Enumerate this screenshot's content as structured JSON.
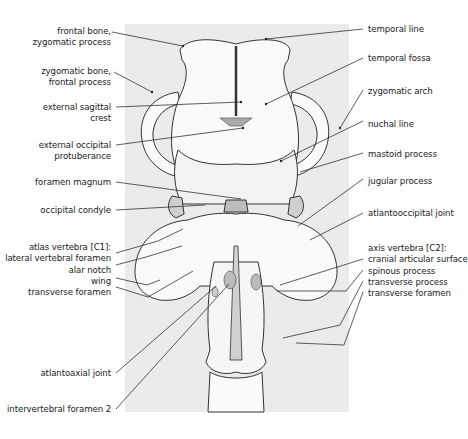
{
  "diagram": {
    "background_panel_color": "#ebebeb",
    "line_color": "#333333",
    "labels_left": [
      {
        "id": "frontal-zygomatic",
        "lines": [
          "frontal bone,",
          "zygomatic process"
        ]
      },
      {
        "id": "zygomatic-frontal",
        "lines": [
          "zygomatic bone,",
          "frontal process"
        ]
      },
      {
        "id": "ext-sagittal-crest",
        "lines": [
          "external sagittal",
          "crest"
        ]
      },
      {
        "id": "ext-occipital-protuberance",
        "lines": [
          "external occipital",
          "protuberance"
        ]
      },
      {
        "id": "foramen-magnum",
        "lines": [
          "foramen magnum"
        ]
      },
      {
        "id": "occipital-condyle",
        "lines": [
          "occipital condyle"
        ]
      },
      {
        "id": "atlas-group",
        "lines": [
          "atlas vertebra [C1]:",
          "lateral vertebral foramen",
          "alar notch",
          "wing",
          "transverse foramen"
        ]
      },
      {
        "id": "atlantoaxial-joint",
        "lines": [
          "atlantoaxial joint"
        ]
      },
      {
        "id": "intervertebral-foramen-2",
        "lines": [
          "intervertebral foramen 2"
        ]
      }
    ],
    "labels_right": [
      {
        "id": "temporal-line",
        "lines": [
          "temporal line"
        ]
      },
      {
        "id": "temporal-fossa",
        "lines": [
          "temporal fossa"
        ]
      },
      {
        "id": "zygomatic-arch",
        "lines": [
          "zygomatic arch"
        ]
      },
      {
        "id": "nuchal-line",
        "lines": [
          "nuchal line"
        ]
      },
      {
        "id": "mastoid-process",
        "lines": [
          "mastoid process"
        ]
      },
      {
        "id": "jugular-process",
        "lines": [
          "jugular process"
        ]
      },
      {
        "id": "atlantooccipital-joint",
        "lines": [
          "atlantooccipital joint"
        ]
      },
      {
        "id": "axis-group",
        "lines": [
          "axis vertebra [C2]:",
          "cranial articular surface",
          "spinous process",
          "transverse process",
          "transverse foramen"
        ]
      }
    ]
  }
}
